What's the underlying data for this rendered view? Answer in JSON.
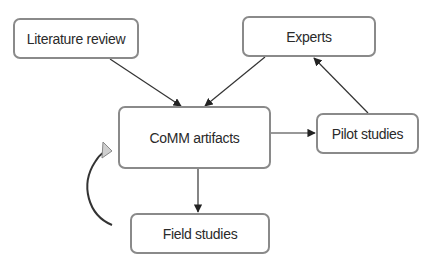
{
  "diagram": {
    "nodes": [
      {
        "id": "literature",
        "label": "Literature review"
      },
      {
        "id": "experts",
        "label": "Experts"
      },
      {
        "id": "comm",
        "label": "CoMM artifacts"
      },
      {
        "id": "pilot",
        "label": "Pilot studies"
      },
      {
        "id": "field",
        "label": "Field studies"
      }
    ],
    "edges": [
      {
        "from": "literature",
        "to": "comm"
      },
      {
        "from": "experts",
        "to": "comm"
      },
      {
        "from": "comm",
        "to": "pilot"
      },
      {
        "from": "pilot",
        "to": "experts"
      },
      {
        "from": "comm",
        "to": "field"
      },
      {
        "from": "field",
        "to": "comm",
        "style": "curved-feedback"
      }
    ],
    "colors": {
      "line": "#333333",
      "box_border": "#8a8a8a",
      "feedback_head": "#cfcfcf"
    }
  }
}
